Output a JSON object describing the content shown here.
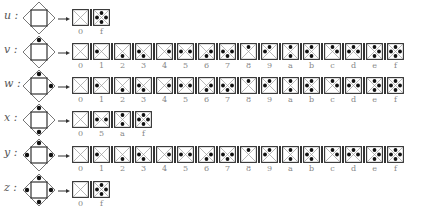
{
  "diagram": {
    "bit_positions": {
      "left": 1,
      "bottom": 2,
      "right": 4,
      "top": 8
    },
    "rows": [
      {
        "var": "u",
        "label": "u :",
        "icon_dots": [],
        "values": [
          "0",
          "f"
        ]
      },
      {
        "var": "v",
        "label": "v :",
        "icon_dots": [
          "top"
        ],
        "values": [
          "0",
          "1",
          "2",
          "3",
          "4",
          "5",
          "6",
          "7",
          "8",
          "9",
          "a",
          "b",
          "c",
          "d",
          "e",
          "f"
        ]
      },
      {
        "var": "w",
        "label": "w :",
        "icon_dots": [
          "top",
          "right"
        ],
        "values": [
          "0",
          "1",
          "2",
          "3",
          "4",
          "5",
          "6",
          "7",
          "8",
          "9",
          "a",
          "b",
          "c",
          "d",
          "e",
          "f"
        ]
      },
      {
        "var": "x",
        "label": "x :",
        "icon_dots": [
          "top",
          "bottom"
        ],
        "values": [
          "0",
          "5",
          "a",
          "f"
        ]
      },
      {
        "var": "y",
        "label": "y :",
        "icon_dots": [
          "top",
          "left",
          "right"
        ],
        "values": [
          "0",
          "1",
          "2",
          "3",
          "4",
          "5",
          "6",
          "7",
          "8",
          "9",
          "a",
          "b",
          "c",
          "d",
          "e",
          "f"
        ]
      },
      {
        "var": "z",
        "label": "z :",
        "icon_dots": [
          "top",
          "left",
          "right",
          "bottom"
        ],
        "values": [
          "0",
          "f"
        ]
      }
    ]
  }
}
